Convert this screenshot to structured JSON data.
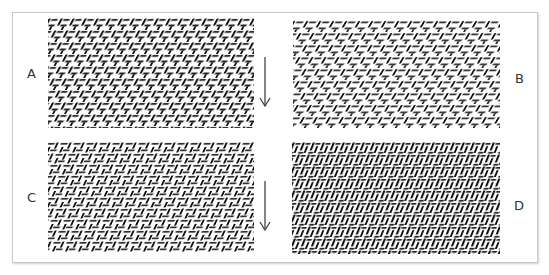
{
  "figure": {
    "panels": [
      {
        "id": "A",
        "label": "A",
        "has_arrow": true,
        "pattern": "diagonal-herringbone-dense"
      },
      {
        "id": "B",
        "label": "B",
        "has_arrow": false,
        "pattern": "diagonal-herringbone-loose"
      },
      {
        "id": "C",
        "label": "C",
        "has_arrow": true,
        "pattern": "diagonal-herringbone-horizontal-bias"
      },
      {
        "id": "D",
        "label": "D",
        "has_arrow": false,
        "pattern": "diagonal-herringbone-vertical-bias"
      }
    ],
    "arrow_icon": "down-arrow-icon",
    "colors": {
      "ink": "#111111",
      "frame": "#c8c8c8",
      "background": "#ffffff"
    }
  }
}
